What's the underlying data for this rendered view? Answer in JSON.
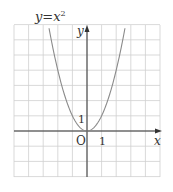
{
  "chart_data": {
    "type": "line",
    "title_parts": {
      "base": "y=x",
      "sup": "2"
    },
    "xlabel": "x",
    "ylabel": "y",
    "origin_label": "O",
    "x_tick_label": "1",
    "y_tick_label": "1",
    "xlim": [
      -5,
      5
    ],
    "ylim": [
      -3,
      7
    ],
    "grid": true,
    "series": [
      {
        "name": "y=x^2",
        "x": [
          -2.6,
          -2.4,
          -2.2,
          -2,
          -1.8,
          -1.6,
          -1.4,
          -1.2,
          -1,
          -0.8,
          -0.6,
          -0.4,
          -0.2,
          0,
          0.2,
          0.4,
          0.6,
          0.8,
          1,
          1.2,
          1.4,
          1.6,
          1.8,
          2,
          2.2,
          2.4,
          2.6
        ],
        "values": [
          6.76,
          5.76,
          4.84,
          4,
          3.24,
          2.56,
          1.96,
          1.44,
          1,
          0.64,
          0.36,
          0.16,
          0.04,
          0,
          0.04,
          0.16,
          0.36,
          0.64,
          1,
          1.44,
          1.96,
          2.56,
          3.24,
          4,
          4.84,
          5.76,
          6.76
        ]
      }
    ]
  },
  "colors": {
    "grid": "#cfcfcf",
    "axis": "#333333",
    "curve": "#8a8a8a",
    "text": "#333333"
  }
}
